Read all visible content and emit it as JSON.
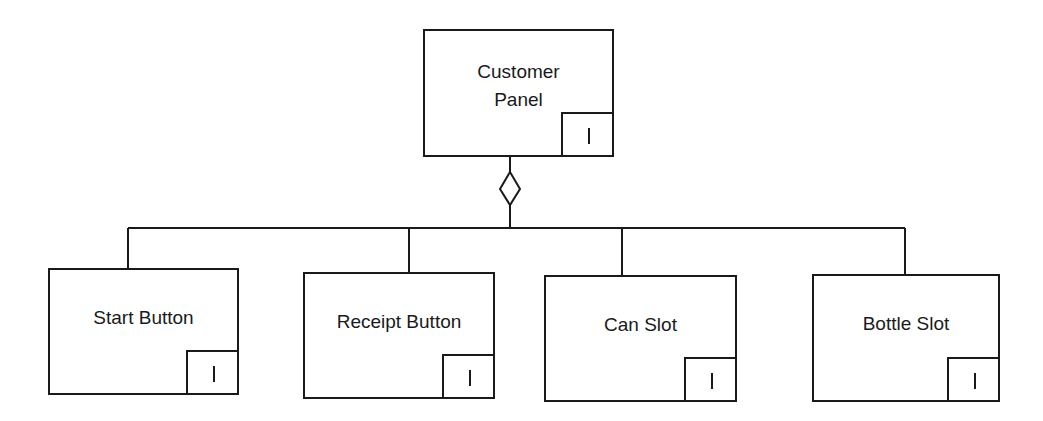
{
  "diagram": {
    "type": "aggregation hierarchy",
    "parent": {
      "label_line1": "Customer",
      "label_line2": "Panel",
      "marker": "I"
    },
    "relationship": {
      "symbol": "hollow-diamond",
      "meaning": "aggregation"
    },
    "children": [
      {
        "label": "Start Button",
        "marker": "I"
      },
      {
        "label": "Receipt Button",
        "marker": "I"
      },
      {
        "label": "Can Slot",
        "marker": "I"
      },
      {
        "label": "Bottle Slot",
        "marker": "I"
      }
    ]
  },
  "colors": {
    "line": "#1a1a1a",
    "background": "#ffffff"
  }
}
